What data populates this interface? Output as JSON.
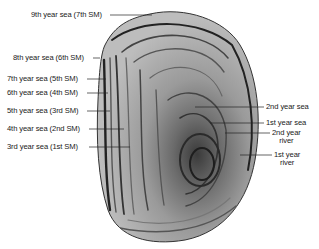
{
  "figure": {
    "labels_left": [
      {
        "id": "9th-year-sea",
        "text": "9th year sea (7th SM)",
        "x": 31,
        "y": 12
      },
      {
        "id": "8th-year-sea",
        "text": "8th year sea (6th SM)",
        "x": 13,
        "y": 55
      },
      {
        "id": "7th-year-sea",
        "text": "7th year sea (5th SM)",
        "x": 7,
        "y": 76
      },
      {
        "id": "6th-year-sea",
        "text": "6th year sea (4th SM)",
        "x": 7,
        "y": 90
      },
      {
        "id": "5th-year-sea",
        "text": "5th year sea (3rd SM)",
        "x": 7,
        "y": 108
      },
      {
        "id": "4th-year-sea",
        "text": "4th year sea (2nd SM)",
        "x": 7,
        "y": 126
      },
      {
        "id": "3rd-year-sea",
        "text": "3rd year sea (1st SM)",
        "x": 7,
        "y": 144
      }
    ],
    "labels_right": [
      {
        "id": "2nd-year-sea",
        "text": "2nd year sea",
        "x": 266,
        "y": 104
      },
      {
        "id": "1st-year-sea",
        "text": "1st year sea",
        "x": 266,
        "y": 120
      },
      {
        "id": "2nd-year-river",
        "lines": [
          "2nd year",
          "river"
        ],
        "x": 272,
        "y": 130
      },
      {
        "id": "1st-year-river",
        "lines": [
          "1st year",
          "river"
        ],
        "x": 274,
        "y": 152
      }
    ]
  }
}
